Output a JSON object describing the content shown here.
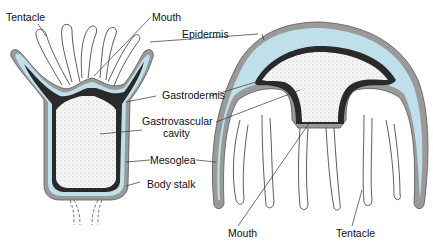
{
  "colors": {
    "epidermis": "#9a9a9a",
    "mesoglea": "#bfe0ea",
    "gastrodermis": "#2a2a2a",
    "cavity": "#f4f4f4"
  },
  "labels": {
    "tentacle_polyp": "Tentacle",
    "mouth_polyp": "Mouth",
    "epidermis": "Epidermis",
    "gastrodermis": "Gastrodermis",
    "gv_cavity_1": "Gastrovascular",
    "gv_cavity_2": "cavity",
    "mesoglea": "Mesoglea",
    "body_stalk": "Body stalk",
    "mouth_medusa": "Mouth",
    "tentacle_medusa": "Tentacle"
  }
}
